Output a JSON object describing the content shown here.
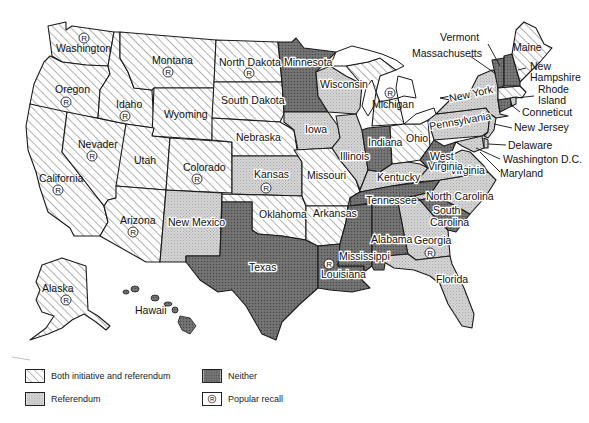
{
  "map": {
    "subject": "United States — direct democracy provisions by state",
    "colors": {
      "both": "#ffffff",
      "both_hatch": "#555555",
      "referendum": "#cfcfcf",
      "neither": "#6e6e6e",
      "outline": "#1a1a1a"
    },
    "states": [
      {
        "name": "Washington",
        "category": "both",
        "recall": true
      },
      {
        "name": "Oregon",
        "category": "both",
        "recall": true
      },
      {
        "name": "California",
        "category": "both",
        "recall": true
      },
      {
        "name": "Nevader",
        "category": "both",
        "recall": true
      },
      {
        "name": "Idaho",
        "category": "both",
        "recall": true
      },
      {
        "name": "Montana",
        "category": "both",
        "recall": true
      },
      {
        "name": "Wyoming",
        "category": "both",
        "recall": false
      },
      {
        "name": "Utah",
        "category": "both",
        "recall": false
      },
      {
        "name": "Arizona",
        "category": "both",
        "recall": true
      },
      {
        "name": "Colorado",
        "category": "both",
        "recall": true
      },
      {
        "name": "New Mexico",
        "category": "referendum",
        "recall": false
      },
      {
        "name": "North Dakota",
        "category": "both",
        "recall": true
      },
      {
        "name": "South Dakota",
        "category": "both",
        "recall": false
      },
      {
        "name": "Nebraska",
        "category": "both",
        "recall": false
      },
      {
        "name": "Kansas",
        "category": "referendum",
        "recall": true
      },
      {
        "name": "Oklahoma",
        "category": "both",
        "recall": false
      },
      {
        "name": "Texas",
        "category": "neither",
        "recall": false
      },
      {
        "name": "Minnesota",
        "category": "neither",
        "recall": false
      },
      {
        "name": "Iowa",
        "category": "referendum",
        "recall": false
      },
      {
        "name": "Missouri",
        "category": "both",
        "recall": false
      },
      {
        "name": "Arkansas",
        "category": "both",
        "recall": false
      },
      {
        "name": "Louisiana",
        "category": "neither",
        "recall": true
      },
      {
        "name": "Wisconsin",
        "category": "referendum",
        "recall": false
      },
      {
        "name": "Illinois",
        "category": "referendum",
        "recall": false
      },
      {
        "name": "Michigan",
        "category": "both",
        "recall": true
      },
      {
        "name": "Indiana",
        "category": "neither",
        "recall": false
      },
      {
        "name": "Ohio",
        "category": "both",
        "recall": false
      },
      {
        "name": "Kentucky",
        "category": "referendum",
        "recall": false
      },
      {
        "name": "Tennessee",
        "category": "neither",
        "recall": false
      },
      {
        "name": "Mississippi",
        "category": "neither",
        "recall": false
      },
      {
        "name": "Alabama",
        "category": "neither",
        "recall": false
      },
      {
        "name": "Georgia",
        "category": "referendum",
        "recall": true
      },
      {
        "name": "Florida",
        "category": "referendum",
        "recall": false
      },
      {
        "name": "South Carolina",
        "category": "neither",
        "recall": false
      },
      {
        "name": "North Carolina",
        "category": "referendum",
        "recall": false
      },
      {
        "name": "Virginia",
        "category": "referendum",
        "recall": false
      },
      {
        "name": "West Virginia",
        "category": "neither",
        "recall": false
      },
      {
        "name": "Pennsylvania",
        "category": "referendum",
        "recall": false
      },
      {
        "name": "New York",
        "category": "referendum",
        "recall": false
      },
      {
        "name": "New Jersey",
        "category": "referendum",
        "recall": false
      },
      {
        "name": "Delaware",
        "category": "referendum",
        "recall": false
      },
      {
        "name": "Maryland",
        "category": "referendum",
        "recall": false
      },
      {
        "name": "Washington D.C.",
        "category": "referendum",
        "recall": false
      },
      {
        "name": "Connecticut",
        "category": "neither",
        "recall": false
      },
      {
        "name": "Rhode Island",
        "category": "referendum",
        "recall": false
      },
      {
        "name": "Massachusetts",
        "category": "both",
        "recall": false
      },
      {
        "name": "Vermont",
        "category": "neither",
        "recall": false
      },
      {
        "name": "New Hampshire",
        "category": "neither",
        "recall": false
      },
      {
        "name": "Maine",
        "category": "both",
        "recall": false
      },
      {
        "name": "Alaska",
        "category": "both",
        "recall": true
      },
      {
        "name": "Hawaii",
        "category": "neither",
        "recall": false
      }
    ],
    "labels": {
      "washington": "Washington",
      "oregon": "Oregon",
      "california": "California",
      "nevader": "Nevader",
      "idaho": "Idaho",
      "montana": "Montana",
      "wyoming": "Wyoming",
      "utah": "Utah",
      "arizona": "Arizona",
      "colorado": "Colorado",
      "new_mexico": "New Mexico",
      "north_dakota": "North Dakota",
      "south_dakota": "South Dakota",
      "nebraska": "Nebraska",
      "kansas": "Kansas",
      "oklahoma": "Oklahoma",
      "texas": "Texas",
      "minnesota": "Minnesota",
      "iowa": "Iowa",
      "missouri": "Missouri",
      "arkansas": "Arkansas",
      "louisiana": "Louisiana",
      "wisconsin": "Wisconsin",
      "illinois": "Illinois",
      "michigan": "Michigan",
      "indiana": "Indiana",
      "ohio": "Ohio",
      "kentucky": "Kentucky",
      "tennessee": "Tennessee",
      "mississippi": "Mississippi",
      "alabama": "Alabama",
      "georgia": "Georgia",
      "florida": "Florida",
      "south": "South",
      "carolina": "Carolina",
      "north_carolina": "North Carolina",
      "virginia": "Virginia",
      "west": "West",
      "virginia2": "Virginia",
      "pennsylvania": "Pennsylvania",
      "new_york": "New York",
      "new_jersey": "New Jersey",
      "delaware": "Delaware",
      "washington_dc": "Washington D.C.",
      "maryland": "Maryland",
      "connecticut": "Conneticut",
      "rhode": "Rhode",
      "island": "Island",
      "massachusetts": "Massachusetts",
      "vermont": "Vermont",
      "new": "New",
      "hampshire": "Hampshire",
      "maine": "Maine",
      "alaska": "Alaska",
      "hawaii": "Hawaii"
    },
    "recall_symbol": "R"
  },
  "legend": {
    "items": [
      {
        "key": "both",
        "label": "Both initiative and referendum"
      },
      {
        "key": "referendum",
        "label": "Referendum"
      },
      {
        "key": "neither",
        "label": "Neither"
      },
      {
        "key": "recall",
        "label": "Popular recall"
      }
    ]
  }
}
